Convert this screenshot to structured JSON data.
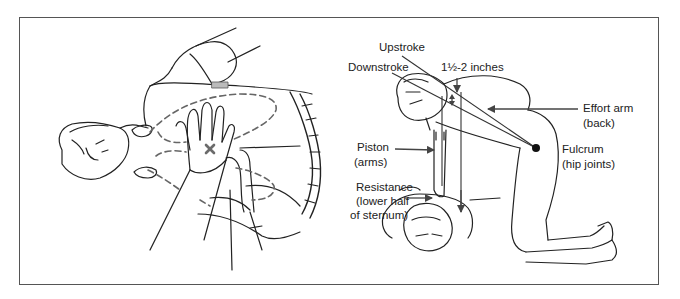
{
  "figure": {
    "left_panel": {
      "description": "Hand placement on lower half of sternum, rescuer's hands over patient's chest with dashed rib-cage outline",
      "marker": "x-mark",
      "marker_color": "#6b6b6b"
    },
    "right_panel": {
      "labels": {
        "upstroke": "Upstroke",
        "downstroke": "Downstroke",
        "depth": "1½-2 inches",
        "effort_arm_line1": "Effort arm",
        "effort_arm_line2": "(back)",
        "fulcrum_line1": "Fulcrum",
        "fulcrum_line2": "(hip joints)",
        "piston_line1": "Piston",
        "piston_line2": "(arms)",
        "resistance_line1": "Resistance",
        "resistance_line2": "(lower half",
        "resistance_line3": "of sternum)"
      }
    }
  },
  "colors": {
    "line": "#222222",
    "arrow": "#555555",
    "border": "#555555",
    "dashed": "#666666"
  }
}
